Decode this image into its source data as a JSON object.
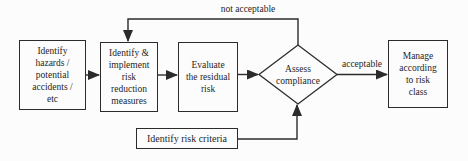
{
  "diagram": {
    "nodes": {
      "identify_hazards": {
        "label": "Identify\nhazards /\npotential\naccidents /\netc"
      },
      "risk_reduction": {
        "label": "Identify &\nimplement\nrisk\nreduction\nmeasures"
      },
      "evaluate_residual": {
        "label": "Evaluate\nthe residual\nrisk"
      },
      "assess_compliance": {
        "label": "Assess\ncompliance",
        "shape": "diamond"
      },
      "manage_risk_class": {
        "label": "Manage\naccording\nto risk\nclass"
      },
      "identify_criteria": {
        "label": "Identify risk criteria"
      }
    },
    "edge_labels": {
      "not_acceptable": "not acceptable",
      "acceptable": "acceptable"
    },
    "colors": {
      "line": "#2b2b2b",
      "background": "#fcfcfc",
      "text": "#1f1f1f"
    }
  }
}
